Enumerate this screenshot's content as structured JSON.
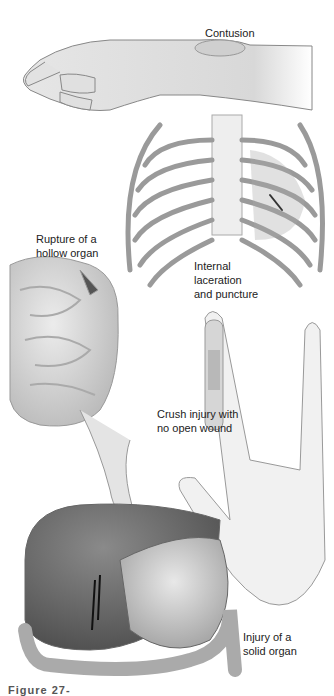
{
  "figure": {
    "labels": {
      "contusion": "Contusion",
      "rupture": [
        "Rupture of a",
        "hollow organ"
      ],
      "laceration": [
        "Internal",
        "laceration",
        "and puncture"
      ],
      "crush": [
        "Crush injury with",
        "no open wound"
      ],
      "solid": [
        "Injury of a",
        "solid organ"
      ]
    },
    "caption": "Figure 27-"
  }
}
